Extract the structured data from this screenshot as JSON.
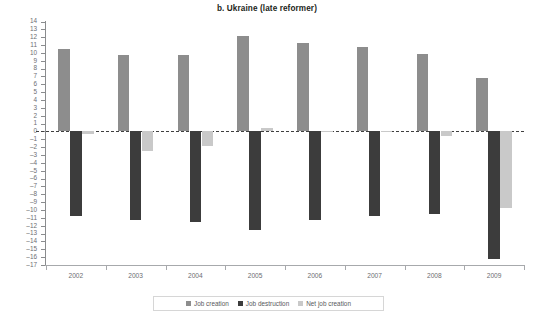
{
  "chart_data": {
    "type": "bar",
    "title": "b. Ukraine (late reformer)",
    "xlabel": "",
    "ylabel": "Percent",
    "categories": [
      "2002",
      "2003",
      "2004",
      "2005",
      "2006",
      "2007",
      "2008",
      "2009"
    ],
    "ylim": [
      -17,
      14
    ],
    "ytick_step": 1,
    "yticks": [
      14,
      13,
      12,
      11,
      10,
      9,
      8,
      7,
      6,
      5,
      4,
      3,
      2,
      1,
      0,
      -1,
      -2,
      -3,
      -4,
      -5,
      -6,
      -7,
      -8,
      -9,
      -10,
      -11,
      -12,
      -13,
      -14,
      -15,
      -16,
      -17
    ],
    "grid": false,
    "zero_line": true,
    "legend_position": "bottom",
    "series": [
      {
        "name": "Job creation",
        "color": "#8d8d8d",
        "values": [
          10.5,
          9.7,
          9.7,
          12.2,
          11.2,
          10.7,
          9.8,
          6.8
        ]
      },
      {
        "name": "Job destruction",
        "color": "#3c3c3c",
        "values": [
          -10.8,
          -11.3,
          -11.5,
          -12.5,
          -11.3,
          -10.8,
          -10.5,
          -16.3
        ]
      },
      {
        "name": "Net job creation",
        "color": "#c9c9c9",
        "values": [
          -0.3,
          -2.5,
          -1.8,
          0.5,
          -0.1,
          -0.1,
          -0.6,
          -9.8
        ]
      }
    ]
  },
  "legend": {
    "items": [
      {
        "label": "Job creation",
        "color": "#8d8d8d"
      },
      {
        "label": "Job destruction",
        "color": "#3c3c3c"
      },
      {
        "label": "Net job creation",
        "color": "#c9c9c9"
      }
    ]
  }
}
